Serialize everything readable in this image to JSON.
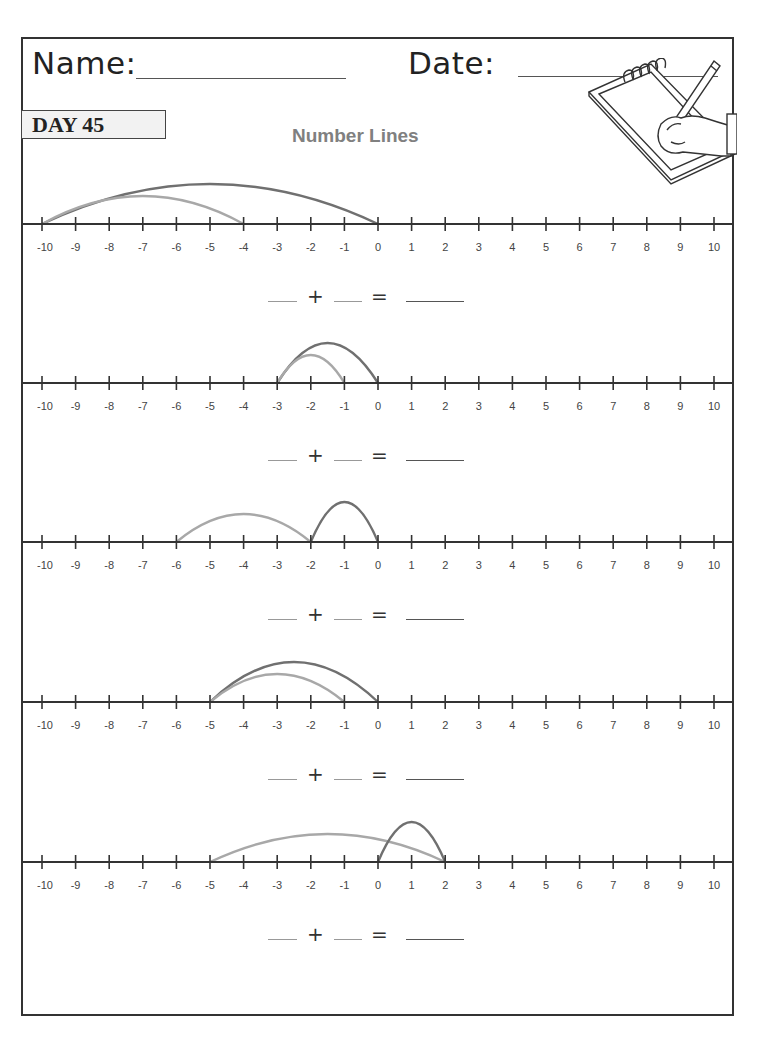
{
  "header": {
    "name_label": "Name:",
    "date_label": "Date:"
  },
  "day_badge": "DAY 45",
  "title": "Number Lines",
  "illustration": "hand-writing-on-notepad",
  "colors": {
    "border": "#333333",
    "axis": "#333333",
    "arc_dark": "#707070",
    "arc_light": "#a8a8a8",
    "title": "#808080",
    "badge_bg": "#f2f2f2"
  },
  "axis": {
    "min": -10,
    "max": 10,
    "tick_labels": [
      "-10",
      "-9",
      "-8",
      "-7",
      "-6",
      "-5",
      "-4",
      "-3",
      "-2",
      "-1",
      "0",
      "1",
      "2",
      "3",
      "4",
      "5",
      "6",
      "7",
      "8",
      "9",
      "10"
    ]
  },
  "equation": {
    "plus": "+",
    "equals": "="
  },
  "problems": [
    {
      "arcs": [
        {
          "from": -10,
          "to": 0,
          "shade": "dark"
        },
        {
          "from": -10,
          "to": -4,
          "shade": "light"
        }
      ]
    },
    {
      "arcs": [
        {
          "from": -3,
          "to": 0,
          "shade": "dark"
        },
        {
          "from": -3,
          "to": -1,
          "shade": "light"
        }
      ]
    },
    {
      "arcs": [
        {
          "from": -6,
          "to": -2,
          "shade": "light"
        },
        {
          "from": -2,
          "to": 0,
          "shade": "dark"
        }
      ]
    },
    {
      "arcs": [
        {
          "from": -5,
          "to": 0,
          "shade": "dark"
        },
        {
          "from": -5,
          "to": -1,
          "shade": "light"
        }
      ]
    },
    {
      "arcs": [
        {
          "from": -5,
          "to": 2,
          "shade": "light"
        },
        {
          "from": 0,
          "to": 2,
          "shade": "dark"
        }
      ]
    }
  ]
}
